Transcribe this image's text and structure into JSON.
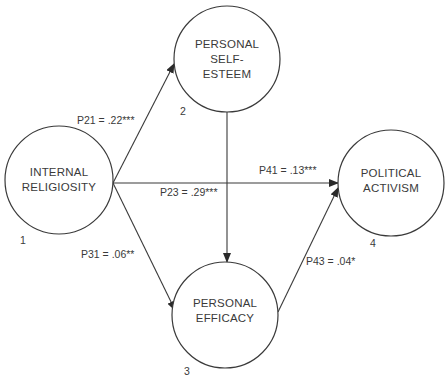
{
  "diagram": {
    "type": "path-analysis",
    "nodes": [
      {
        "id": 1,
        "label_lines": [
          "INTERNAL",
          "RELIGIOSITY"
        ],
        "number": "1"
      },
      {
        "id": 2,
        "label_lines": [
          "PERSONAL",
          "SELF-",
          "ESTEEM"
        ],
        "number": "2"
      },
      {
        "id": 3,
        "label_lines": [
          "PERSONAL",
          "EFFICACY"
        ],
        "number": "3"
      },
      {
        "id": 4,
        "label_lines": [
          "POLITICAL",
          "ACTIVISM"
        ],
        "number": "4"
      }
    ],
    "paths": [
      {
        "id": "p21",
        "from": 1,
        "to": 2,
        "label": "P21 = .22***"
      },
      {
        "id": "p23",
        "from": 2,
        "to": 3,
        "label": "P23 = .29***"
      },
      {
        "id": "p41",
        "from": 1,
        "to": 4,
        "label": "P41 = .13***"
      },
      {
        "id": "p31",
        "from": 1,
        "to": 3,
        "label": "P31 = .06**"
      },
      {
        "id": "p43",
        "from": 3,
        "to": 4,
        "label": "P43 = .04*"
      }
    ]
  }
}
